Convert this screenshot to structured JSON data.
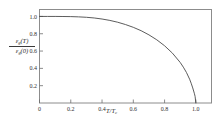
{
  "figure": {
    "background_color": "#ffffff",
    "frame_color": "#8c8c8c",
    "curve_color": "#4a4a4a",
    "tick_color": "#6e6e6e",
    "text_color": "#2f2f2f"
  },
  "ylabel": {
    "numerator_eps": "ε",
    "numerator_sub": "g",
    "numerator_arg": "(T)",
    "denominator_eps": "ε",
    "denominator_sub": "g",
    "denominator_arg": "(0)"
  },
  "xlabel": {
    "symbol": "T/T",
    "subscript": "c"
  },
  "chart_data": {
    "type": "line",
    "title": "",
    "subtitle": "",
    "xlabel": "T/T_c",
    "ylabel": "ε_g(T)/ε_g(0)",
    "xlim": [
      0,
      1.1
    ],
    "ylim": [
      0,
      1.08
    ],
    "grid": false,
    "legend": false,
    "legend_position": "none",
    "xticks": [
      0,
      0.2,
      0.4,
      0.6,
      0.8,
      1.0
    ],
    "xticklabels": [
      "0",
      "0.2",
      "0.4",
      "0.6",
      "0.8",
      "1.0"
    ],
    "yticks": [
      0.2,
      0.4,
      0.6,
      0.8,
      1.0
    ],
    "yticklabels": [
      "0.2",
      "0.4",
      "0.6",
      "0.8",
      "1.0"
    ],
    "tick_direction": "in",
    "series": [
      {
        "name": "BCS energy gap",
        "x": [
          0.0,
          0.05,
          0.1,
          0.15,
          0.2,
          0.25,
          0.3,
          0.35,
          0.4,
          0.45,
          0.5,
          0.55,
          0.6,
          0.65,
          0.7,
          0.75,
          0.8,
          0.85,
          0.9,
          0.92,
          0.94,
          0.96,
          0.97,
          0.98,
          0.99,
          0.995,
          1.0
        ],
        "y": [
          1.0,
          1.0,
          1.0,
          0.999,
          0.998,
          0.995,
          0.99,
          0.982,
          0.97,
          0.954,
          0.933,
          0.906,
          0.874,
          0.835,
          0.787,
          0.73,
          0.661,
          0.576,
          0.468,
          0.414,
          0.352,
          0.275,
          0.228,
          0.174,
          0.113,
          0.077,
          0.0
        ]
      }
    ]
  }
}
